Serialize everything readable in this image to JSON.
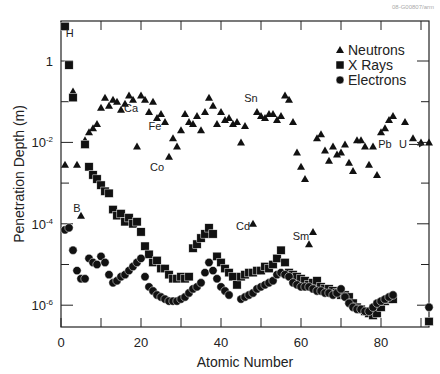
{
  "watermark": "08-G00807/arm",
  "chart_data": {
    "type": "scatter",
    "title": "",
    "xlabel": "Atomic Number",
    "ylabel": "Penetration Depth (m)",
    "xlim": [
      0,
      92
    ],
    "ylim_log10": [
      -6.5,
      1
    ],
    "yscale": "log",
    "x_ticks": [
      0,
      20,
      40,
      60,
      80
    ],
    "x_minor_ticks": [
      10,
      30,
      50,
      70,
      90
    ],
    "y_ticks": [
      {
        "log10": 0,
        "label": "1"
      },
      {
        "log10": -2,
        "label": "10-2"
      },
      {
        "log10": -4,
        "label": "10-4"
      },
      {
        "log10": -6,
        "label": "10-6"
      }
    ],
    "y_minor_ticks_log10": [
      -1,
      -3,
      -5
    ],
    "grid": false,
    "legend": {
      "position": "upper right",
      "entries": [
        "Neutrons",
        "X Rays",
        "Electrons"
      ]
    },
    "annotations": [
      {
        "text": "H",
        "x": 2.2,
        "log10": 0.7
      },
      {
        "text": "B",
        "x": 4,
        "log10": -3.6
      },
      {
        "text": "Ca",
        "x": 17.5,
        "log10": -1.15
      },
      {
        "text": "Fe",
        "x": 23.5,
        "log10": -1.6
      },
      {
        "text": "Co",
        "x": 24,
        "log10": -2.6
      },
      {
        "text": "Cd",
        "x": 45.5,
        "log10": -4.05
      },
      {
        "text": "Sn",
        "x": 47.5,
        "log10": -0.9
      },
      {
        "text": "Sm",
        "x": 60,
        "log10": -4.3
      },
      {
        "text": "Pb",
        "x": 81,
        "log10": -2.05
      },
      {
        "text": "U",
        "x": 85.5,
        "log10": -2.05,
        "arrow_to": 91.5
      }
    ],
    "series": [
      {
        "name": "Neutrons",
        "marker": "triangle",
        "points": [
          [
            1,
            -2.55
          ],
          [
            3,
            -0.75
          ],
          [
            4,
            -2.55
          ],
          [
            5,
            -3.8
          ],
          [
            6,
            -1.95
          ],
          [
            7,
            -1.75
          ],
          [
            8,
            -1.65
          ],
          [
            9,
            -1.55
          ],
          [
            10,
            -1.15
          ],
          [
            11,
            -0.9
          ],
          [
            12,
            -1.1
          ],
          [
            13,
            -0.95
          ],
          [
            14,
            -1.0
          ],
          [
            15,
            -1.2
          ],
          [
            16,
            -1.05
          ],
          [
            17,
            -0.85
          ],
          [
            18,
            -0.95
          ],
          [
            19,
            -2.1
          ],
          [
            20,
            -0.85
          ],
          [
            21,
            -0.95
          ],
          [
            22,
            -1.25
          ],
          [
            23,
            -1.0
          ],
          [
            24,
            -1.4
          ],
          [
            25,
            -1.3
          ],
          [
            26,
            -1.5
          ],
          [
            27,
            -2.35
          ],
          [
            28,
            -1.9
          ],
          [
            29,
            -2.1
          ],
          [
            30,
            -1.7
          ],
          [
            31,
            -1.3
          ],
          [
            32,
            -1.5
          ],
          [
            33,
            -1.55
          ],
          [
            34,
            -1.35
          ],
          [
            35,
            -1.7
          ],
          [
            36,
            -1.25
          ],
          [
            37,
            -0.9
          ],
          [
            38,
            -1.1
          ],
          [
            39,
            -1.55
          ],
          [
            40,
            -1.25
          ],
          [
            41,
            -1.45
          ],
          [
            42,
            -1.4
          ],
          [
            43,
            -1.55
          ],
          [
            44,
            -1.5
          ],
          [
            45,
            -2.0
          ],
          [
            46,
            -1.6
          ],
          [
            48,
            -4.0
          ],
          [
            49,
            -1.25
          ],
          [
            50,
            -1.35
          ],
          [
            51,
            -1.4
          ],
          [
            52,
            -1.3
          ],
          [
            53,
            -1.3
          ],
          [
            54,
            -1.45
          ],
          [
            55,
            -1.35
          ],
          [
            56,
            -0.85
          ],
          [
            57,
            -0.95
          ],
          [
            58,
            -1.5
          ],
          [
            59,
            -2.25
          ],
          [
            60,
            -2.6
          ],
          [
            61,
            -2.9
          ],
          [
            62,
            -4.5
          ],
          [
            63,
            -4.2
          ],
          [
            64,
            -1.9
          ],
          [
            65,
            -1.8
          ],
          [
            66,
            -2.2
          ],
          [
            67,
            -2.45
          ],
          [
            68,
            -2.1
          ],
          [
            69,
            -2.3
          ],
          [
            70,
            -2.25
          ],
          [
            71,
            -2.05
          ],
          [
            72,
            -2.5
          ],
          [
            73,
            -2.7
          ],
          [
            74,
            -1.95
          ],
          [
            75,
            -1.95
          ],
          [
            76,
            -2.1
          ],
          [
            77,
            -2.55
          ],
          [
            78,
            -2.1
          ],
          [
            79,
            -2.8
          ],
          [
            80,
            -1.75
          ],
          [
            81,
            -1.65
          ],
          [
            82,
            -1.45
          ],
          [
            83,
            -1.35
          ],
          [
            86,
            -1.5
          ],
          [
            88,
            -1.9
          ],
          [
            90,
            -2.0
          ],
          [
            92,
            -2.0
          ]
        ]
      },
      {
        "name": "X Rays",
        "marker": "square",
        "points": [
          [
            1,
            0.85
          ],
          [
            2,
            -0.1
          ],
          [
            3,
            -0.9
          ],
          [
            6,
            -2.05
          ],
          [
            7,
            -2.6
          ],
          [
            8,
            -2.8
          ],
          [
            9,
            -2.9
          ],
          [
            10,
            -3.05
          ],
          [
            11,
            -3.2
          ],
          [
            12,
            -3.25
          ],
          [
            13,
            -3.65
          ],
          [
            14,
            -3.8
          ],
          [
            15,
            -3.75
          ],
          [
            16,
            -3.95
          ],
          [
            17,
            -3.85
          ],
          [
            18,
            -4.0
          ],
          [
            19,
            -3.95
          ],
          [
            20,
            -4.2
          ],
          [
            21,
            -4.55
          ],
          [
            22,
            -4.75
          ],
          [
            23,
            -4.95
          ],
          [
            24,
            -4.9
          ],
          [
            25,
            -5.1
          ],
          [
            26,
            -5.1
          ],
          [
            27,
            -5.25
          ],
          [
            28,
            -5.35
          ],
          [
            29,
            -5.35
          ],
          [
            30,
            -5.3
          ],
          [
            31,
            -5.35
          ],
          [
            32,
            -5.3
          ],
          [
            33,
            -4.6
          ],
          [
            34,
            -4.5
          ],
          [
            35,
            -4.35
          ],
          [
            36,
            -4.25
          ],
          [
            37,
            -4.1
          ],
          [
            38,
            -4.25
          ],
          [
            39,
            -4.8
          ],
          [
            40,
            -4.95
          ],
          [
            41,
            -5.1
          ],
          [
            42,
            -5.2
          ],
          [
            43,
            -5.3
          ],
          [
            44,
            -5.5
          ],
          [
            45,
            -5.3
          ],
          [
            46,
            -5.25
          ],
          [
            47,
            -5.2
          ],
          [
            48,
            -5.2
          ],
          [
            49,
            -5.15
          ],
          [
            50,
            -5.15
          ],
          [
            51,
            -5.05
          ],
          [
            52,
            -5.1
          ],
          [
            53,
            -5.0
          ],
          [
            54,
            -4.85
          ],
          [
            55,
            -4.65
          ],
          [
            56,
            -4.95
          ],
          [
            57,
            -5.2
          ],
          [
            58,
            -5.25
          ],
          [
            59,
            -5.3
          ],
          [
            60,
            -5.35
          ],
          [
            61,
            -5.4
          ],
          [
            62,
            -5.5
          ],
          [
            63,
            -5.45
          ],
          [
            64,
            -5.4
          ],
          [
            65,
            -5.55
          ],
          [
            66,
            -5.6
          ],
          [
            67,
            -5.6
          ],
          [
            68,
            -5.65
          ],
          [
            69,
            -5.7
          ],
          [
            70,
            -5.75
          ],
          [
            71,
            -5.75
          ],
          [
            72,
            -5.8
          ],
          [
            73,
            -5.95
          ],
          [
            74,
            -6.05
          ],
          [
            75,
            -6.1
          ],
          [
            76,
            -6.15
          ],
          [
            77,
            -6.2
          ],
          [
            78,
            -6.25
          ],
          [
            79,
            -6.2
          ],
          [
            80,
            -6.05
          ],
          [
            81,
            -5.9
          ],
          [
            82,
            -5.85
          ],
          [
            83,
            -5.85
          ],
          [
            92,
            -6.4
          ]
        ]
      },
      {
        "name": "Electrons",
        "marker": "circle",
        "points": [
          [
            1,
            -4.15
          ],
          [
            2,
            -4.1
          ],
          [
            3,
            -4.65
          ],
          [
            4,
            -5.15
          ],
          [
            5,
            -5.35
          ],
          [
            6,
            -5.35
          ],
          [
            7,
            -4.85
          ],
          [
            8,
            -4.95
          ],
          [
            9,
            -5.0
          ],
          [
            10,
            -4.8
          ],
          [
            11,
            -4.95
          ],
          [
            12,
            -5.25
          ],
          [
            13,
            -5.45
          ],
          [
            14,
            -5.4
          ],
          [
            15,
            -5.3
          ],
          [
            16,
            -5.25
          ],
          [
            17,
            -5.15
          ],
          [
            18,
            -5.05
          ],
          [
            19,
            -4.95
          ],
          [
            20,
            -4.85
          ],
          [
            21,
            -5.3
          ],
          [
            22,
            -5.55
          ],
          [
            23,
            -5.65
          ],
          [
            24,
            -5.75
          ],
          [
            25,
            -5.8
          ],
          [
            26,
            -5.85
          ],
          [
            27,
            -5.9
          ],
          [
            28,
            -5.9
          ],
          [
            29,
            -5.9
          ],
          [
            30,
            -5.85
          ],
          [
            31,
            -5.8
          ],
          [
            32,
            -5.7
          ],
          [
            33,
            -5.6
          ],
          [
            34,
            -5.55
          ],
          [
            35,
            -5.45
          ],
          [
            36,
            -5.2
          ],
          [
            37,
            -4.95
          ],
          [
            38,
            -5.15
          ],
          [
            39,
            -5.35
          ],
          [
            40,
            -5.55
          ],
          [
            41,
            -5.65
          ],
          [
            42,
            -5.75
          ],
          [
            45,
            -5.85
          ],
          [
            46,
            -5.8
          ],
          [
            47,
            -5.75
          ],
          [
            48,
            -5.7
          ],
          [
            49,
            -5.6
          ],
          [
            50,
            -5.55
          ],
          [
            51,
            -5.5
          ],
          [
            52,
            -5.45
          ],
          [
            53,
            -5.4
          ],
          [
            54,
            -5.25
          ],
          [
            55,
            -5.2
          ],
          [
            56,
            -5.25
          ],
          [
            57,
            -5.3
          ],
          [
            58,
            -5.45
          ],
          [
            59,
            -5.5
          ],
          [
            60,
            -5.55
          ],
          [
            61,
            -5.55
          ],
          [
            62,
            -5.55
          ],
          [
            63,
            -5.6
          ],
          [
            64,
            -5.65
          ],
          [
            65,
            -5.65
          ],
          [
            66,
            -5.7
          ],
          [
            67,
            -5.7
          ],
          [
            68,
            -5.75
          ],
          [
            69,
            -5.7
          ],
          [
            70,
            -5.6
          ],
          [
            71,
            -5.8
          ],
          [
            72,
            -5.95
          ],
          [
            73,
            -6.05
          ],
          [
            74,
            -6.1
          ],
          [
            75,
            -6.1
          ],
          [
            76,
            -6.15
          ],
          [
            77,
            -6.15
          ],
          [
            78,
            -6.05
          ],
          [
            79,
            -5.95
          ],
          [
            80,
            -5.9
          ],
          [
            81,
            -5.85
          ],
          [
            82,
            -5.8
          ],
          [
            83,
            -5.75
          ],
          [
            92,
            -6.05
          ]
        ]
      }
    ]
  }
}
